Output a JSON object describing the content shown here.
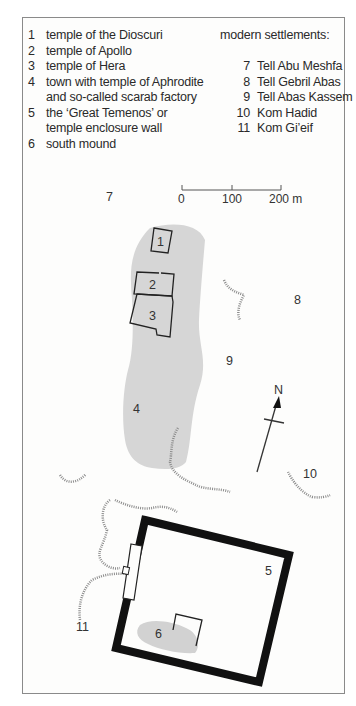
{
  "legend": {
    "sites": [
      {
        "num": "1",
        "lines": [
          "temple of the Dioscuri"
        ]
      },
      {
        "num": "2",
        "lines": [
          "temple of Apollo"
        ]
      },
      {
        "num": "3",
        "lines": [
          "temple of Hera"
        ]
      },
      {
        "num": "4",
        "lines": [
          "town with temple of Aphrodite",
          "and so-called scarab factory"
        ]
      },
      {
        "num": "5",
        "lines": [
          "the ‘Great Temenos’ or",
          "temple enclosure wall"
        ]
      },
      {
        "num": "6",
        "lines": [
          "south mound"
        ]
      }
    ],
    "modern_heading": "modern settlements:",
    "modern": [
      {
        "num": "7",
        "name": "Tell Abu Meshfa"
      },
      {
        "num": "8",
        "name": "Tell Gebril Abas"
      },
      {
        "num": "9",
        "name": "Tell Abas Kassem"
      },
      {
        "num": "10",
        "name": "Kom Hadid"
      },
      {
        "num": "11",
        "name": "Kom Gi’eif"
      }
    ]
  },
  "scale_bar": {
    "ticks": [
      "0",
      "100",
      "200 m"
    ]
  },
  "north_arrow": {
    "label": "N"
  },
  "map_labels": {
    "l1": "1",
    "l2": "2",
    "l3": "3",
    "l4": "4",
    "l5": "5",
    "l6": "6",
    "l7": "7",
    "l8": "8",
    "l9": "9",
    "l10": "10",
    "l11": "11"
  },
  "colors": {
    "mound": "#d6d6d6",
    "wall": "#111111",
    "contour": "#8c8c8c",
    "border": "#8a8a8a"
  }
}
